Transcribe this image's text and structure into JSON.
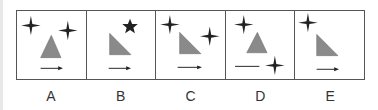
{
  "options": [
    {
      "label": "A",
      "triangle": "isosceles",
      "stars": [
        "four-point",
        "four-point"
      ],
      "arrow": "right-arrow"
    },
    {
      "label": "B",
      "triangle": "right",
      "stars": [
        "five-point"
      ],
      "arrow": "right-arrow"
    },
    {
      "label": "C",
      "triangle": "right",
      "stars": [
        "four-point",
        "four-point"
      ],
      "arrow": "right-arrow"
    },
    {
      "label": "D",
      "triangle": "isosceles",
      "stars": [
        "four-point",
        "four-point"
      ],
      "arrow": "line"
    },
    {
      "label": "E",
      "triangle": "right",
      "stars": [
        "four-point"
      ],
      "arrow": "right-arrow"
    }
  ],
  "colors": {
    "triangle": "#8a8a8a",
    "star": "#222222",
    "border": "#555555"
  }
}
